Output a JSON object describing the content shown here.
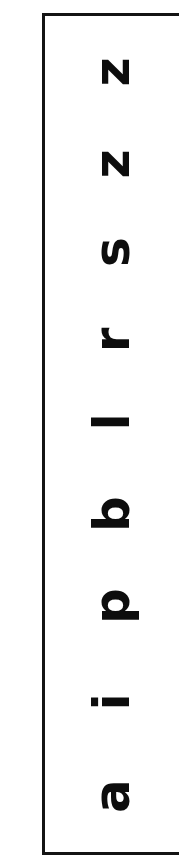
{
  "page": {
    "background_color": "#ffffff",
    "width": 179,
    "height": 862,
    "orientation": "rotated-90-ccw"
  },
  "top_sliver": {
    "text": "handwriting",
    "description": "faint partially-cropped text line at the very top edge",
    "color": "#9a9a9a"
  },
  "label": {
    "text": "Lesson One:",
    "color": "#1b1b1b",
    "rotation": "-90deg"
  },
  "letter_box": {
    "border_color": "#141414",
    "border_width": "3.5px",
    "fill_color": "#ffffff",
    "clipped_right_edge": true
  },
  "letters": [
    {
      "char": "z",
      "name": "letter-z-1",
      "top": 28
    },
    {
      "char": "z",
      "name": "letter-z-2",
      "top": 120
    },
    {
      "char": "s",
      "name": "letter-s",
      "top": 208
    },
    {
      "char": "r",
      "name": "letter-r",
      "top": 296
    },
    {
      "char": "l",
      "name": "letter-l",
      "top": 378
    },
    {
      "char": "b",
      "name": "letter-b",
      "top": 470
    },
    {
      "char": "p",
      "name": "letter-p",
      "top": 562
    },
    {
      "char": "i",
      "name": "letter-i",
      "top": 658
    },
    {
      "char": "a",
      "name": "letter-a",
      "top": 752
    }
  ],
  "letters_reading_order_bottom_to_top": "a i p b l r s z z"
}
